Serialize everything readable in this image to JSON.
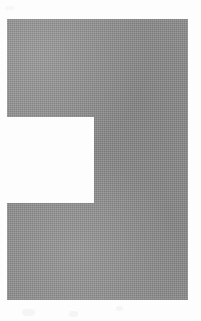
{
  "canvas": {
    "width": 201,
    "height": 321,
    "background_color": "#fdfdfd"
  },
  "figure": {
    "name": "gray-notched-block",
    "fill_color": "#8b8b8b",
    "texture": "halftone-dither",
    "bounds": {
      "left": 7,
      "top": 19,
      "right": 188,
      "bottom": 300,
      "width": 181,
      "height": 281
    },
    "notch": {
      "name": "left-side-notch",
      "fill_color": "#fdfdfd",
      "left": 0,
      "top": 117,
      "right": 94,
      "bottom": 203,
      "width": 94,
      "height": 86
    }
  },
  "artifacts": {
    "label": "scan-smudges",
    "color": "#f2f2f2",
    "count": 4
  },
  "caption": {
    "alt_text": "Abstract gray geometric block with a rectangular notch cut from the left side"
  }
}
